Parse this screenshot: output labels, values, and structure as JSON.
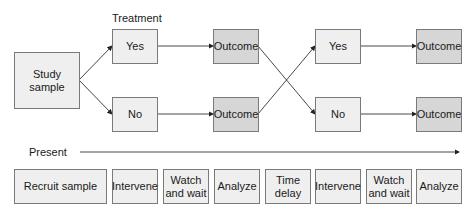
{
  "diagram": {
    "treatment_label": "Treatment",
    "present_label": "Present",
    "study_sample": "Study sample",
    "branch1": {
      "yes": "Yes",
      "no": "No"
    },
    "outcome1": {
      "top": "Outcome",
      "bottom": "Outcome"
    },
    "branch2": {
      "yes": "Yes",
      "no": "No"
    },
    "outcome2": {
      "top": "Outcome",
      "bottom": "Outcome"
    },
    "timeline": [
      "Recruit sample",
      "Intervene",
      "Watch and wait",
      "Analyze",
      "Time delay",
      "Intervene",
      "Watch and wait",
      "Analyze"
    ]
  }
}
